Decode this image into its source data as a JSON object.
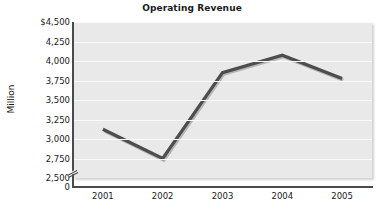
{
  "chart_data": {
    "type": "line",
    "title": "Operating Revenue",
    "xlabel": "",
    "ylabel": "Million",
    "categories": [
      "2001",
      "2002",
      "2003",
      "2004",
      "2005"
    ],
    "values": [
      3125,
      2750,
      3850,
      4075,
      3775
    ],
    "series": [
      {
        "name": "Operating Revenue",
        "values": [
          3125,
          2750,
          3850,
          4075,
          3775
        ]
      }
    ],
    "ylim": [
      2500,
      4500
    ],
    "y_ticks": [
      4500,
      4250,
      4000,
      3750,
      3500,
      3250,
      3000,
      2750,
      2500
    ],
    "y_tick_labels": [
      "$4,500",
      "4,250",
      "4,000",
      "3,750",
      "3,500",
      "3,250",
      "3,000",
      "2,750",
      "2,500"
    ],
    "y_axis_origin_label": "0",
    "axis_break": true,
    "grid": true,
    "legend": "none",
    "line_color": "#4d4d4d",
    "plot_background": "#e9e9e9",
    "gridline_color": "#fafafa",
    "axis_color": "#4a4a4a"
  }
}
